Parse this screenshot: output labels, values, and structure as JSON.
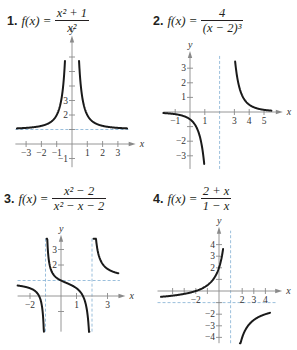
{
  "problems": [
    {
      "number": "1.",
      "fx": "f(x)",
      "eq": "=",
      "numerator": "x² + 1",
      "denominator": "x²",
      "graph": {
        "origin": [
          72,
          144
        ],
        "sx": 15.3,
        "sy": 14.5,
        "x_range": [
          -3.7,
          3.9
        ],
        "y_range": [
          -1.6,
          7.2
        ],
        "x_ticks": [
          -3,
          -2,
          -1,
          1,
          2,
          3
        ],
        "x_tick_labels": [
          "−3",
          "−2",
          "−1",
          "1",
          "2",
          "3"
        ],
        "y_ticks": [
          -1,
          1,
          2,
          3,
          4,
          5,
          6
        ],
        "y_tick_labels": {
          "-1": "−1",
          "2": "2",
          "3": "3"
        },
        "h_asymptotes": [
          1
        ],
        "v_asymptotes": [],
        "function": "(x*x+1)/(x*x)",
        "segments": [
          [
            -3.6,
            -0.46
          ],
          [
            0.46,
            3.6
          ]
        ]
      }
    },
    {
      "number": "2.",
      "fx": "f(x)",
      "eq": "=",
      "numerator": "4",
      "denominator": "(x − 2)³",
      "graph": {
        "origin": [
          190,
          112
        ],
        "sx": 14.8,
        "sy": 14.6,
        "x_range": [
          -1.8,
          6.0
        ],
        "y_range": [
          -3.9,
          3.9
        ],
        "x_ticks": [
          -1,
          1,
          3,
          4,
          5
        ],
        "x_tick_labels": [
          "−1",
          "1",
          "3",
          "4",
          "5"
        ],
        "y_ticks": [
          -3,
          -2,
          -1,
          1,
          2,
          3
        ],
        "y_tick_labels": {
          "-3": "−3",
          "-2": "−2",
          "1": "1",
          "2": "2",
          "3": "3"
        },
        "h_asymptotes": [],
        "v_asymptotes": [
          2
        ],
        "function": "4/Math.pow(x-2,3)",
        "segments": [
          [
            -1.8,
            0.96
          ],
          [
            3.05,
            5.5
          ]
        ]
      }
    },
    {
      "number": "3.",
      "fx": "f(x)",
      "eq": "=",
      "numerator": "x² − 2",
      "denominator": "x² − x − 2",
      "graph": {
        "origin": [
          61,
          296
        ],
        "sx": 15.5,
        "sy": 15.5,
        "x_range": [
          -2.8,
          3.9
        ],
        "y_range": [
          -2.3,
          3.7
        ],
        "x_ticks": [
          -2,
          1,
          3
        ],
        "x_tick_labels": [
          "−2",
          "1",
          "3"
        ],
        "y_ticks": [
          -1,
          2,
          3
        ],
        "y_tick_labels": {
          "2": "2",
          "3": "3"
        },
        "h_asymptotes": [
          1
        ],
        "v_asymptotes": [
          -1,
          2
        ],
        "function": "(x*x-2)/(x*x-x-2)",
        "segments": [
          [
            -2.8,
            -1.1
          ],
          [
            -0.93,
            1.83
          ],
          [
            2.1,
            3.7
          ]
        ]
      }
    },
    {
      "number": "4.",
      "fx": "f(x)",
      "eq": "=",
      "numerator": "2 + x",
      "denominator": "1 − x",
      "graph": {
        "origin": [
          219,
          291
        ],
        "sx": 11.6,
        "sy": 11.6,
        "x_range": [
          -5.3,
          5.1
        ],
        "y_range": [
          -4.5,
          5.2
        ],
        "x_ticks": [
          -4,
          -3,
          -2,
          -1,
          2,
          3,
          4
        ],
        "x_tick_labels": [
          "",
          "",
          "−2",
          "",
          "2",
          "3",
          "4"
        ],
        "y_ticks": [
          -4,
          -3,
          -2,
          -1,
          1,
          2,
          3,
          4
        ],
        "y_tick_labels": {
          "-4": "−4",
          "-3": "−3",
          "-2": "−2",
          "2": "2",
          "3": "3",
          "4": "4"
        },
        "h_asymptotes": [
          -1
        ],
        "v_asymptotes": [
          1
        ],
        "function": "(2+x)/(1-x)",
        "segments": [
          [
            -5.0,
            0.35
          ],
          [
            1.8,
            4.4
          ]
        ]
      }
    }
  ],
  "axis_labels": {
    "x": "x",
    "y": "y"
  },
  "colors": {
    "curve": "#1a1a1a",
    "axis": "#8a8a8a",
    "asymptote": "#8fb8d8"
  }
}
